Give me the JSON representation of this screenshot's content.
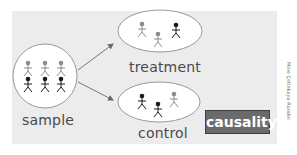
{
  "diagram": {
    "nodes": {
      "sample": {
        "label": "sample",
        "figures": [
          {
            "x": 28,
            "y": 63,
            "color": "gray"
          },
          {
            "x": 45,
            "y": 63,
            "color": "gray"
          },
          {
            "x": 61,
            "y": 63,
            "color": "gray"
          },
          {
            "x": 28,
            "y": 79,
            "color": "black"
          },
          {
            "x": 45,
            "y": 79,
            "color": "black"
          },
          {
            "x": 61,
            "y": 79,
            "color": "black"
          }
        ]
      },
      "treatment": {
        "label": "treatment",
        "figures": [
          {
            "x": 142,
            "y": 24,
            "color": "gray"
          },
          {
            "x": 158,
            "y": 34,
            "color": "gray"
          },
          {
            "x": 176,
            "y": 25,
            "color": "black"
          }
        ]
      },
      "control": {
        "label": "control",
        "figures": [
          {
            "x": 142,
            "y": 96,
            "color": "black"
          },
          {
            "x": 158,
            "y": 104,
            "color": "black"
          },
          {
            "x": 174,
            "y": 94,
            "color": "gray"
          }
        ]
      }
    },
    "edges": [
      {
        "from": "sample",
        "to": "treatment"
      },
      {
        "from": "sample",
        "to": "control"
      }
    ],
    "badge": "causality",
    "credit": "Mine Çetinkaya-Rundel"
  },
  "colors": {
    "panel": "#ececec",
    "figure_gray": "#8c8c8c",
    "figure_black": "#1a1a1a",
    "badge_bg": "#6b6b6b"
  }
}
